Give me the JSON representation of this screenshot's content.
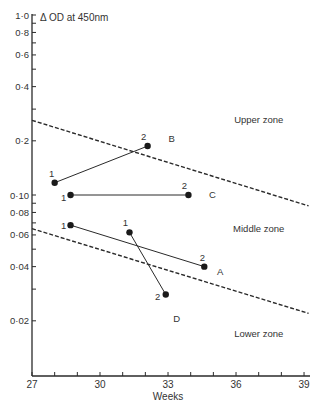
{
  "chart_data": {
    "type": "line",
    "title": "",
    "ylabel": "Δ OD at 450nm",
    "xlabel": "Weeks",
    "yscale": "log",
    "ylim": [
      0.01,
      1.0
    ],
    "xlim": [
      27,
      39
    ],
    "grid": false,
    "x_ticks": [
      27,
      30,
      33,
      36,
      39
    ],
    "x_minor_ticks": [
      28,
      29,
      31,
      32,
      34,
      35,
      37,
      38
    ],
    "y_ticks": [
      {
        "value": 1.0,
        "label": "1·0"
      },
      {
        "value": 0.8,
        "label": "0·8"
      },
      {
        "value": 0.6,
        "label": "0·6"
      },
      {
        "value": 0.4,
        "label": "0·4"
      },
      {
        "value": 0.2,
        "label": "0·2"
      },
      {
        "value": 0.1,
        "label": "0·10"
      },
      {
        "value": 0.08,
        "label": "0·08"
      },
      {
        "value": 0.06,
        "label": "0·06"
      },
      {
        "value": 0.04,
        "label": "0·04"
      },
      {
        "value": 0.02,
        "label": "0·02"
      }
    ],
    "y_minor_ticks": [
      0.9,
      0.7,
      0.5,
      0.3,
      0.09,
      0.07,
      0.05,
      0.03
    ],
    "series": [
      {
        "name": "A",
        "points": [
          {
            "label": "1",
            "x": 28.7,
            "y": 0.068
          },
          {
            "label": "2",
            "x": 34.6,
            "y": 0.04
          }
        ]
      },
      {
        "name": "B",
        "points": [
          {
            "label": "1",
            "x": 28.0,
            "y": 0.117
          },
          {
            "label": "2",
            "x": 32.1,
            "y": 0.187
          }
        ]
      },
      {
        "name": "C",
        "points": [
          {
            "label": "1",
            "x": 28.7,
            "y": 0.1
          },
          {
            "label": "2",
            "x": 33.9,
            "y": 0.1
          }
        ]
      },
      {
        "name": "D",
        "points": [
          {
            "label": "1",
            "x": 31.3,
            "y": 0.062
          },
          {
            "label": "2",
            "x": 32.9,
            "y": 0.028
          }
        ]
      }
    ],
    "boundaries": [
      {
        "name": "upper-boundary",
        "style": "dashed",
        "from": {
          "x": 27,
          "y": 0.26
        },
        "to": {
          "x": 39.2,
          "y": 0.087
        }
      },
      {
        "name": "lower-boundary",
        "style": "dashed",
        "from": {
          "x": 27,
          "y": 0.065
        },
        "to": {
          "x": 39.2,
          "y": 0.022
        }
      }
    ],
    "annotations": [
      {
        "text": "Upper zone",
        "x": 37.0,
        "y": 0.26
      },
      {
        "text": "Middle zone",
        "x": 37.0,
        "y": 0.065
      },
      {
        "text": "Lower zone",
        "x": 37.0,
        "y": 0.017
      }
    ]
  },
  "labels": {
    "ylabel": "Δ OD at 450nm",
    "xlabel": "Weeks",
    "upper_zone": "Upper zone",
    "middle_zone": "Middle zone",
    "lower_zone": "Lower zone"
  }
}
